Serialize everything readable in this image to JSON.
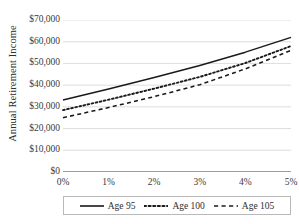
{
  "chart_data": {
    "type": "line",
    "title": "",
    "xlabel": "",
    "ylabel": "Annual Retirement Income",
    "x": [
      0,
      1,
      2,
      3,
      4,
      5
    ],
    "categories": [
      "0%",
      "1%",
      "2%",
      "3%",
      "4%",
      "5%"
    ],
    "xlim": [
      0,
      5
    ],
    "ylim": [
      0,
      70000
    ],
    "ytick_labels": [
      "$0",
      "$10,000",
      "$20,000",
      "$30,000",
      "$40,000",
      "$50,000",
      "$60,000",
      "$70,000"
    ],
    "ytick_values": [
      0,
      10000,
      20000,
      30000,
      40000,
      50000,
      60000,
      70000
    ],
    "grid": true,
    "grid_color": "#d4d4d4",
    "legend_position": "bottom",
    "series": [
      {
        "name": "Age 95",
        "style": "solid",
        "color": "#1a1a1a",
        "values": [
          33200,
          38200,
          43500,
          49100,
          55200,
          62000
        ]
      },
      {
        "name": "Age 100",
        "style": "dotted",
        "color": "#1a1a1a",
        "values": [
          28500,
          33300,
          38400,
          43800,
          50200,
          58000
        ]
      },
      {
        "name": "Age 105",
        "style": "dashed",
        "color": "#1a1a1a",
        "values": [
          25000,
          29700,
          34700,
          40200,
          47500,
          56000
        ]
      }
    ]
  },
  "axis": {
    "baseline_color": "#404040"
  }
}
